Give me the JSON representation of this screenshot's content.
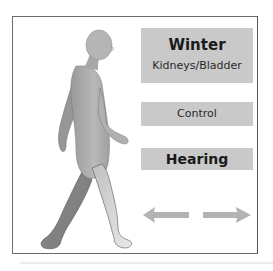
{
  "diagram": {
    "season": "Winter",
    "organs": "Kidneys/Bladder",
    "function": "Control",
    "sense": "Hearing",
    "arrows": {
      "left": "arrow-left",
      "right": "arrow-right"
    },
    "figure": "walking-human-figure"
  },
  "colors": {
    "box_fill": "#c9c9c9",
    "frame_border": "#6a6a6a",
    "arrow_fill": "#b3b3b3",
    "figure_fill": "#a8a8a8"
  }
}
